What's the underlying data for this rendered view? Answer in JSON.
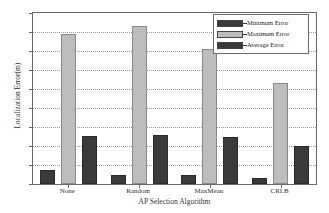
{
  "chart_data": {
    "type": "bar",
    "title": "",
    "xlabel": "AP Selection Algorithm",
    "ylabel": "Localization Error(m)",
    "categories": [
      "None",
      "Random",
      "MaxMean",
      "CRLB"
    ],
    "series": [
      {
        "name": "Minimum Error",
        "values": [
          0.75,
          0.5,
          0.45,
          0.3
        ],
        "color": "#3a3a3a"
      },
      {
        "name": "Maximum Error",
        "values": [
          7.9,
          8.3,
          7.1,
          5.3
        ],
        "color": "#bdbdbd"
      },
      {
        "name": "Average Error",
        "values": [
          2.55,
          2.6,
          2.45,
          2.0
        ],
        "color": "#3a3a3a"
      }
    ],
    "ylim": [
      0,
      9
    ],
    "yticks": [
      "0",
      "1",
      "2",
      "3",
      "4",
      "5",
      "6",
      "7",
      "8",
      "9"
    ],
    "grid": true,
    "legend_position": "top-right"
  },
  "legend": {
    "entries": [
      {
        "label": "Minimum Error",
        "swatch": "#3a3a3a"
      },
      {
        "label": "Maximum Error",
        "swatch": "#bdbdbd"
      },
      {
        "label": "Average Error",
        "swatch": "#3a3a3a"
      }
    ]
  }
}
